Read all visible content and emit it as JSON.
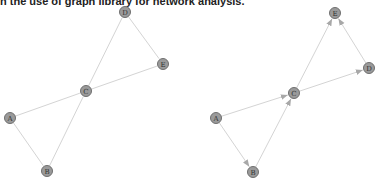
{
  "caption": "n the use of graph library for network analysis.",
  "graphs": [
    {
      "name": "undirected",
      "nodes": [
        {
          "id": "A",
          "x": 10,
          "y": 118
        },
        {
          "id": "B",
          "x": 47,
          "y": 171
        },
        {
          "id": "C",
          "x": 86,
          "y": 91
        },
        {
          "id": "D",
          "x": 125,
          "y": 12
        },
        {
          "id": "E",
          "x": 163,
          "y": 64
        }
      ],
      "edges": [
        [
          "A",
          "C"
        ],
        [
          "A",
          "B"
        ],
        [
          "B",
          "C"
        ],
        [
          "C",
          "D"
        ],
        [
          "C",
          "E"
        ],
        [
          "D",
          "E"
        ]
      ]
    },
    {
      "name": "directed",
      "nodes": [
        {
          "id": "A",
          "x": 216,
          "y": 118
        },
        {
          "id": "B",
          "x": 253,
          "y": 172
        },
        {
          "id": "C",
          "x": 294,
          "y": 93
        },
        {
          "id": "D",
          "x": 369,
          "y": 68
        },
        {
          "id": "E",
          "x": 335,
          "y": 13
        }
      ],
      "edges": [
        [
          "A",
          "C"
        ],
        [
          "A",
          "B"
        ],
        [
          "B",
          "C"
        ],
        [
          "C",
          "E"
        ],
        [
          "C",
          "D"
        ],
        [
          "D",
          "E"
        ]
      ]
    }
  ],
  "colors": {
    "node_fill": "#9a9a9a",
    "node_stroke": "#6f6f6f",
    "edge": "#d4d4d4",
    "arrow": "#a8a8a8"
  }
}
